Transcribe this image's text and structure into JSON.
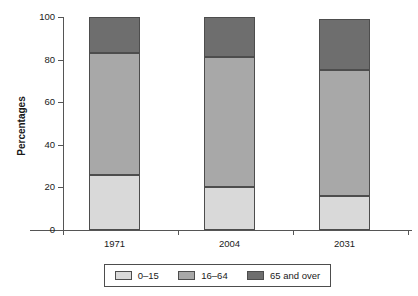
{
  "chart_data": {
    "type": "bar",
    "stacked": true,
    "title": "",
    "subtitle": "",
    "xlabel": "",
    "ylabel": "Percentages",
    "ylim": [
      0,
      100
    ],
    "yticks": [
      0,
      20,
      40,
      60,
      80,
      100
    ],
    "ytick_labels": [
      "0",
      "20",
      "40",
      "60",
      "80",
      "100"
    ],
    "grid": false,
    "legend_position": "bottom",
    "categories": [
      "1971",
      "2004",
      "2031"
    ],
    "series": [
      {
        "name": "0–15",
        "color": "#d9d9d9",
        "values": [
          26,
          20,
          16
        ]
      },
      {
        "name": "16–64",
        "color": "#a8a8a8",
        "values": [
          57,
          61,
          59
        ]
      },
      {
        "name": "65 and over",
        "color": "#6e6e6e",
        "values": [
          17,
          19,
          24
        ]
      }
    ],
    "totals": [
      100,
      100,
      99
    ],
    "annotations": []
  },
  "axis": {
    "y_title": "Percentages",
    "y_labels": [
      "100",
      "80",
      "60",
      "40",
      "20",
      "0"
    ],
    "x_labels": [
      "1971",
      "2004",
      "2031"
    ]
  },
  "legend": {
    "items": [
      {
        "label": "0–15",
        "color": "#d9d9d9"
      },
      {
        "label": "16–64",
        "color": "#a8a8a8"
      },
      {
        "label": "65 and over",
        "color": "#6e6e6e"
      }
    ]
  },
  "colors": {
    "axis": "#555555",
    "bar_border": "#4d4d4d",
    "background": "#ffffff",
    "text": "#1a1a1a"
  }
}
